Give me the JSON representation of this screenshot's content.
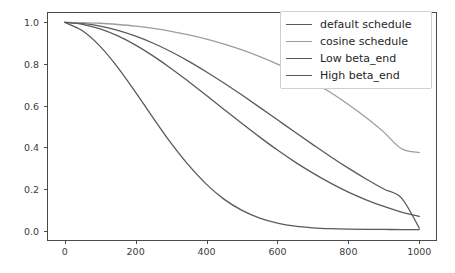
{
  "figure": {
    "background_color": "#ffffff",
    "axes_color": "#4a4a4a",
    "tick_label_color": "#3b3b3b"
  },
  "legend": {
    "position": "upper right",
    "border_color": "#cfcfcf",
    "background_color": "#ffffff",
    "entries": [
      {
        "label": "default schedule",
        "color": "#5a5a5a"
      },
      {
        "label": "cosine schedule",
        "color": "#9d9d9d"
      },
      {
        "label": "Low beta_end",
        "color": "#5a5a5a"
      },
      {
        "label": "High beta_end",
        "color": "#5a5a5a"
      }
    ]
  },
  "axes": {
    "x_tick_labels": [
      "0",
      "200",
      "400",
      "600",
      "800",
      "1000"
    ],
    "y_tick_labels": [
      "0.0",
      "0.2",
      "0.4",
      "0.6",
      "0.8",
      "1.0"
    ]
  },
  "chart_data": {
    "type": "line",
    "title": "",
    "xlabel": "",
    "ylabel": "",
    "xlim": [
      -50,
      1050
    ],
    "ylim": [
      -0.05,
      1.05
    ],
    "grid": false,
    "legend_position": "upper right",
    "x_ticks": [
      0,
      200,
      400,
      600,
      800,
      1000
    ],
    "y_ticks": [
      0.0,
      0.2,
      0.4,
      0.6,
      0.8,
      1.0
    ],
    "x": [
      0,
      50,
      100,
      150,
      200,
      250,
      300,
      350,
      400,
      450,
      500,
      550,
      600,
      650,
      700,
      750,
      800,
      850,
      900,
      950,
      1000
    ],
    "series": [
      {
        "name": "default schedule",
        "color": "#5a5a5a",
        "values": [
          1.0,
          0.995,
          0.982,
          0.962,
          0.934,
          0.9,
          0.859,
          0.813,
          0.762,
          0.708,
          0.651,
          0.592,
          0.532,
          0.472,
          0.413,
          0.355,
          0.3,
          0.248,
          0.2,
          0.156,
          0.012
        ]
      },
      {
        "name": "cosine schedule",
        "color": "#9d9d9d",
        "values": [
          1.0,
          0.999,
          0.996,
          0.99,
          0.982,
          0.971,
          0.957,
          0.94,
          0.92,
          0.896,
          0.868,
          0.836,
          0.8,
          0.759,
          0.714,
          0.663,
          0.606,
          0.543,
          0.473,
          0.393,
          0.375
        ]
      },
      {
        "name": "Low beta_end",
        "color": "#5a5a5a",
        "values": [
          1.0,
          0.991,
          0.969,
          0.935,
          0.891,
          0.838,
          0.779,
          0.715,
          0.649,
          0.581,
          0.514,
          0.449,
          0.387,
          0.329,
          0.276,
          0.228,
          0.185,
          0.148,
          0.116,
          0.089,
          0.068
        ]
      },
      {
        "name": "High beta_end",
        "color": "#5a5a5a",
        "values": [
          1.0,
          0.96,
          0.885,
          0.783,
          0.664,
          0.54,
          0.42,
          0.313,
          0.222,
          0.15,
          0.097,
          0.06,
          0.036,
          0.021,
          0.013,
          0.009,
          0.007,
          0.006,
          0.0055,
          0.005,
          0.005
        ]
      }
    ]
  }
}
